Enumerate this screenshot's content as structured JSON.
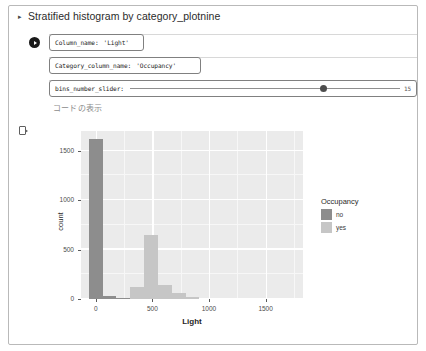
{
  "header": {
    "title": "Stratified histogram by category_plotnine",
    "disclosure_glyph": "▸"
  },
  "widgets": {
    "run_marker": "run-icon",
    "column_name": {
      "label": "Column_name:",
      "value": "'Light'"
    },
    "category_column_name": {
      "label": "Category_column_name:",
      "value": "'Occupancy'"
    },
    "bins_slider": {
      "label": "bins_number_slider:",
      "value": "15",
      "percent": 70.5
    },
    "show_code": "コードの表示"
  },
  "output": {
    "marker": "output-prompt-icon"
  },
  "colors": {
    "panel_bg": "#ebebeb",
    "grid_major": "#ffffff",
    "series_no": "#8d8d8d",
    "series_yes": "#c6c6c6",
    "axis_text": "#4d4d4d"
  },
  "chart_data": {
    "type": "bar",
    "title": "",
    "xlabel": "Light",
    "ylabel": "count",
    "xlim": [
      -130,
      1830
    ],
    "ylim": [
      0,
      1700
    ],
    "xticks": [
      0,
      500,
      1000,
      1500
    ],
    "yticks": [
      0,
      500,
      1000,
      1500
    ],
    "grid": true,
    "legend": {
      "title": "Occupancy",
      "position": "right",
      "entries": [
        {
          "label": "no",
          "color": "#8d8d8d"
        },
        {
          "label": "yes",
          "color": "#c6c6c6"
        }
      ]
    },
    "bin_width": 122,
    "series": [
      {
        "name": "no",
        "color": "#8d8d8d",
        "bins": [
          {
            "x0": -61,
            "x1": 61,
            "value": 1620
          },
          {
            "x0": 61,
            "x1": 183,
            "value": 30
          },
          {
            "x0": 183,
            "x1": 305,
            "value": 8
          }
        ]
      },
      {
        "name": "yes",
        "color": "#c6c6c6",
        "bins": [
          {
            "x0": 305,
            "x1": 427,
            "value": 120
          },
          {
            "x0": 427,
            "x1": 549,
            "value": 650
          },
          {
            "x0": 549,
            "x1": 671,
            "value": 145
          },
          {
            "x0": 671,
            "x1": 793,
            "value": 60
          },
          {
            "x0": 793,
            "x1": 915,
            "value": 18
          }
        ]
      }
    ]
  }
}
